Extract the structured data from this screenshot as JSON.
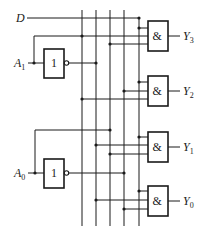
{
  "diagram": {
    "type": "logic-circuit",
    "inputs": {
      "enable": {
        "label": "D"
      },
      "a1": {
        "label": "A",
        "sub": "1"
      },
      "a0": {
        "label": "A",
        "sub": "0"
      }
    },
    "inverters": [
      {
        "id": "inv-a1",
        "symbol": "1"
      },
      {
        "id": "inv-a0",
        "symbol": "1"
      }
    ],
    "gates": [
      {
        "id": "and-y3",
        "symbol": "&",
        "output_label": "Y",
        "output_sub": "3",
        "inputs": [
          "D",
          "A1",
          "A0"
        ]
      },
      {
        "id": "and-y2",
        "symbol": "&",
        "output_label": "Y",
        "output_sub": "2",
        "inputs": [
          "D",
          "A1",
          "A0'"
        ]
      },
      {
        "id": "and-y1",
        "symbol": "&",
        "output_label": "Y",
        "output_sub": "1",
        "inputs": [
          "D",
          "A1'",
          "A0"
        ]
      },
      {
        "id": "and-y0",
        "symbol": "&",
        "output_label": "Y",
        "output_sub": "0",
        "inputs": [
          "D",
          "A1'",
          "A0'"
        ]
      }
    ],
    "buses": [
      "A1",
      "A1'",
      "A0",
      "A0'",
      "D"
    ],
    "colors": {
      "line": "#1a1a1a",
      "background": "#ffffff"
    }
  }
}
